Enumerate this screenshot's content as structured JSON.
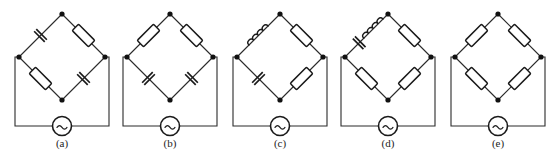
{
  "figure": {
    "background_color": "#ffffff",
    "line_color": "#2b2b2b",
    "component_color": "#1a1a1a",
    "node_color": "#111111",
    "panel_count": 5
  },
  "legend": {
    "component_names": {
      "resistor": "resistor",
      "capacitor": "capacitor",
      "inductor": "inductor",
      "source": "ac-source"
    },
    "source_symbol": "~"
  },
  "panels": [
    {
      "id": "a",
      "caption": "(a)",
      "arms": {
        "top_left": "capacitor",
        "top_right": "resistor",
        "bottom_left": "resistor",
        "bottom_right": "capacitor"
      },
      "arm_series": {
        "top_left": [
          "capacitor"
        ],
        "top_right": [
          "resistor"
        ],
        "bottom_left": [
          "resistor"
        ],
        "bottom_right": [
          "capacitor"
        ]
      },
      "source": "ac-source",
      "node_count": 4
    },
    {
      "id": "b",
      "caption": "(b)",
      "arms": {
        "top_left": "resistor",
        "top_right": "resistor",
        "bottom_left": "capacitor",
        "bottom_right": "capacitor"
      },
      "arm_series": {
        "top_left": [
          "resistor"
        ],
        "top_right": [
          "resistor"
        ],
        "bottom_left": [
          "capacitor"
        ],
        "bottom_right": [
          "capacitor"
        ]
      },
      "source": "ac-source",
      "node_count": 4
    },
    {
      "id": "c",
      "caption": "(c)",
      "arms": {
        "top_left": "inductor",
        "top_right": "resistor",
        "bottom_left": "capacitor",
        "bottom_right": "resistor"
      },
      "arm_series": {
        "top_left": [
          "inductor"
        ],
        "top_right": [
          "resistor"
        ],
        "bottom_left": [
          "capacitor"
        ],
        "bottom_right": [
          "resistor"
        ]
      },
      "source": "ac-source",
      "node_count": 4
    },
    {
      "id": "d",
      "caption": "(d)",
      "arms": {
        "top_left": "capacitor-inductor-series",
        "top_right": "resistor",
        "bottom_left": "resistor",
        "bottom_right": "resistor"
      },
      "arm_series": {
        "top_left": [
          "capacitor",
          "inductor"
        ],
        "top_right": [
          "resistor"
        ],
        "bottom_left": [
          "resistor"
        ],
        "bottom_right": [
          "resistor"
        ]
      },
      "source": "ac-source",
      "node_count": 4
    },
    {
      "id": "e",
      "caption": "(e)",
      "arms": {
        "top_left": "resistor",
        "top_right": "resistor",
        "bottom_left": "resistor",
        "bottom_right": "resistor"
      },
      "arm_series": {
        "top_left": [
          "resistor"
        ],
        "top_right": [
          "resistor"
        ],
        "bottom_left": [
          "resistor"
        ],
        "bottom_right": [
          "resistor"
        ]
      },
      "source": "ac-source",
      "node_count": 4
    }
  ]
}
